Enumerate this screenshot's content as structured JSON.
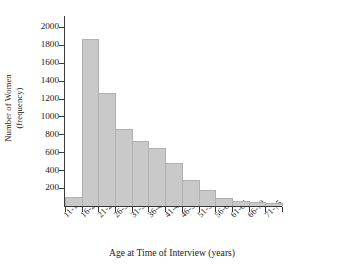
{
  "chart_data": {
    "type": "bar",
    "title": "",
    "xlabel": "Age at Time of Interview (years)",
    "ylabel": "Number of Women (frequency)",
    "ylabel_line1": "Number of Women",
    "ylabel_line2": "(frequency)",
    "categories": [
      "11-15",
      "16-20",
      "21-25",
      "26-30",
      "31-35",
      "36-40",
      "41-45",
      "46-50",
      "51-55",
      "56-60",
      "61-65",
      "66-70",
      "71-75"
    ],
    "values": [
      100,
      1870,
      1260,
      860,
      730,
      650,
      480,
      290,
      180,
      90,
      55,
      40,
      30
    ],
    "ylim": [
      0,
      2100
    ],
    "xlim": [
      0,
      13
    ],
    "yticks": [
      200,
      400,
      600,
      800,
      1000,
      1200,
      1400,
      1600,
      1800,
      2000
    ],
    "ytick_labels": [
      "200",
      "400",
      "600",
      "800",
      "1000",
      "1200",
      "1400",
      "1600",
      "1800",
      "2000"
    ],
    "grid": false,
    "legend": null,
    "bar_color": "#c9c9c9",
    "bar_edge_color": "#b0b0b0",
    "axis_color": "#3a3a3a"
  }
}
